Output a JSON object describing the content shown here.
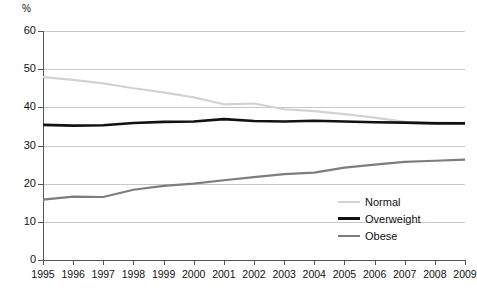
{
  "chart_data": {
    "type": "line",
    "title": "",
    "xlabel": "",
    "ylabel": "%",
    "ylim": [
      0,
      60
    ],
    "ytick_step": 10,
    "yticks": [
      "0",
      "10",
      "20",
      "30",
      "40",
      "50",
      "60"
    ],
    "grid": true,
    "legend_position": "lower-right",
    "categories": [
      "1995",
      "1996",
      "1997",
      "1998",
      "1999",
      "2000",
      "2001",
      "2002",
      "2003",
      "2004",
      "2005",
      "2006",
      "2007",
      "2008",
      "2009"
    ],
    "series": [
      {
        "name": "Normal",
        "color": "#d2d2d2",
        "values": [
          47.9,
          47.2,
          46.3,
          45.0,
          43.9,
          42.6,
          40.8,
          41.0,
          39.5,
          39.0,
          38.2,
          37.3,
          36.2,
          36.0,
          35.9
        ]
      },
      {
        "name": "Overweight",
        "color": "#111111",
        "values": [
          35.4,
          35.2,
          35.3,
          35.9,
          36.2,
          36.3,
          36.9,
          36.4,
          36.3,
          36.5,
          36.3,
          36.1,
          36.0,
          35.8,
          35.8
        ]
      },
      {
        "name": "Obese",
        "color": "#7d7d7d",
        "values": [
          15.8,
          16.6,
          16.5,
          18.4,
          19.4,
          20.0,
          20.9,
          21.7,
          22.5,
          22.9,
          24.2,
          25.0,
          25.7,
          26.0,
          26.3
        ]
      }
    ]
  },
  "legend": {
    "items": [
      {
        "label": "Normal"
      },
      {
        "label": "Overweight"
      },
      {
        "label": "Obese"
      }
    ]
  },
  "axes": {
    "y_unit_label": "%"
  }
}
